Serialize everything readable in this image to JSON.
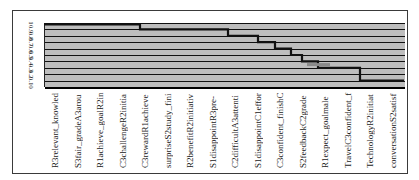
{
  "chart_data": {
    "type": "line",
    "subtype": "step",
    "title": "",
    "xlabel": "",
    "ylabel": "",
    "ylim": [
      0,
      1
    ],
    "yticks": [
      "1",
      "0.9",
      "0.8",
      "0.7",
      "0.6",
      "0.5",
      "0.4",
      "0.3",
      "0.2",
      "0.1",
      "0"
    ],
    "grid": true,
    "legend": null,
    "background": "#bdbdbd",
    "line_color": "#111111",
    "categories": [
      "R3relevant_knowled",
      "S3fair_gradeA3arou",
      "R1achieve_goalR2in",
      "C3challengeR2initia",
      "C3rewardR1achieve",
      "surpriseS2study_fini",
      "R2benefitR2initiativ",
      "S1disappointR3pre-",
      "C2difficultA3attenti",
      "S1disappointC1effor",
      "C3confident_finishC",
      "S2feedbackC2grade",
      "R1expect_goalmale",
      "TravelC3confident_f",
      "TechnologyR2initiat",
      "conversationS2satisf"
    ],
    "series": [
      {
        "name": "step",
        "points": [
          {
            "x_px": 0,
            "y": 0.98
          },
          {
            "x_px": 96,
            "y": 0.98
          },
          {
            "x_px": 96,
            "y": 0.9
          },
          {
            "x_px": 184,
            "y": 0.9
          },
          {
            "x_px": 184,
            "y": 0.8
          },
          {
            "x_px": 214,
            "y": 0.8
          },
          {
            "x_px": 214,
            "y": 0.7
          },
          {
            "x_px": 231,
            "y": 0.7
          },
          {
            "x_px": 231,
            "y": 0.6
          },
          {
            "x_px": 247,
            "y": 0.6
          },
          {
            "x_px": 247,
            "y": 0.5
          },
          {
            "x_px": 258,
            "y": 0.5
          },
          {
            "x_px": 258,
            "y": 0.4
          },
          {
            "x_px": 274,
            "y": 0.4
          },
          {
            "x_px": 274,
            "y": 0.3
          },
          {
            "x_px": 316,
            "y": 0.3
          },
          {
            "x_px": 316,
            "y": 0.1
          },
          {
            "x_px": 360,
            "y": 0.1
          }
        ]
      },
      {
        "name": "gray-segment",
        "color": "#8a8a8a",
        "points": [
          {
            "x_px": 263,
            "y": 0.35
          },
          {
            "x_px": 286,
            "y": 0.35
          }
        ]
      }
    ]
  }
}
